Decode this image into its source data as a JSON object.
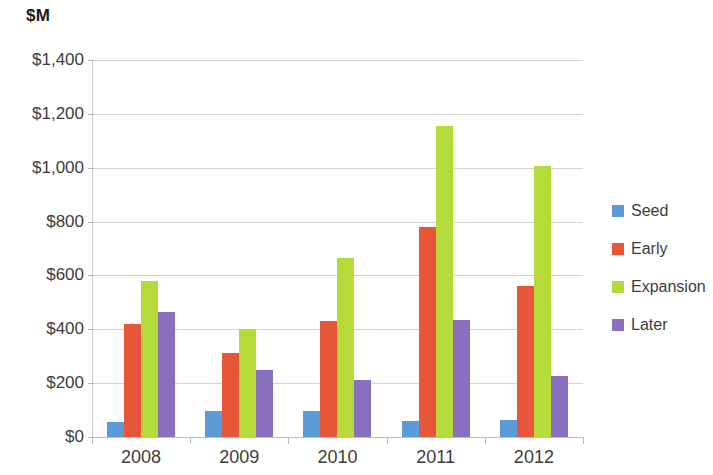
{
  "chart_data": {
    "type": "bar",
    "title": "",
    "subtitle": "",
    "xlabel": "",
    "ylabel": "$M",
    "ylim": [
      0,
      1400
    ],
    "ytick_step": 200,
    "ytick_labels": [
      "$1,400",
      "$1,200",
      "$1,000",
      "$800",
      "$600",
      "$400",
      "$200",
      "$0"
    ],
    "ytick_values": [
      1400,
      1200,
      1000,
      800,
      600,
      400,
      200,
      0
    ],
    "grid": true,
    "legend_position": "right",
    "categories": [
      "2008",
      "2009",
      "2010",
      "2011",
      "2012"
    ],
    "series": [
      {
        "name": "Seed",
        "color": "#5B9BD5",
        "values": [
          55,
          95,
          95,
          60,
          65
        ]
      },
      {
        "name": "Early",
        "color": "#E8563A",
        "values": [
          418,
          312,
          430,
          780,
          560
        ]
      },
      {
        "name": "Expansion",
        "color": "#B5DB3A",
        "values": [
          578,
          400,
          665,
          1155,
          1005
        ]
      },
      {
        "name": "Later",
        "color": "#8B6FBF",
        "values": [
          465,
          250,
          210,
          435,
          225
        ]
      }
    ]
  },
  "axis_unit_title": "$M"
}
